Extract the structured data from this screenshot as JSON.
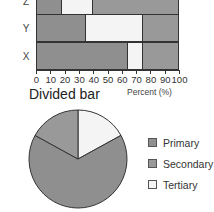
{
  "colors": {
    "primary": "#8f8f8f",
    "secondary": "#999999",
    "tertiary": "#f4f4f4",
    "outline": "#333333"
  },
  "chart_data": [
    {
      "type": "bar",
      "orientation": "horizontal",
      "stacked": true,
      "title": "Divided bar",
      "xlabel": "Percent (%)",
      "ylabel": "",
      "xlim": [
        0,
        100
      ],
      "x_ticks": [
        "0",
        "10",
        "20",
        "30",
        "40",
        "50",
        "60",
        "70",
        "80",
        "90",
        "100"
      ],
      "categories": [
        "Z",
        "Y",
        "X"
      ],
      "series": [
        {
          "name": "Primary",
          "values": [
            18,
            35,
            64
          ]
        },
        {
          "name": "Tertiary",
          "values": [
            22,
            40,
            11
          ]
        },
        {
          "name": "Secondary",
          "values": [
            60,
            25,
            25
          ]
        }
      ],
      "grid": false
    },
    {
      "type": "pie",
      "title": "",
      "labels": [
        "Primary",
        "Secondary",
        "Tertiary"
      ],
      "values": [
        66,
        17,
        17
      ],
      "legend_position": "right"
    }
  ],
  "bar_chart": {
    "title": "Divided bar",
    "xlabel": "Percent (%)",
    "ticks": [
      "0",
      "10",
      "20",
      "30",
      "40",
      "50",
      "60",
      "70",
      "80",
      "90",
      "100"
    ],
    "rows": [
      {
        "label": "Z",
        "segments": [
          {
            "name": "Primary",
            "value": 18
          },
          {
            "name": "Tertiary",
            "value": 22
          },
          {
            "name": "Secondary",
            "value": 60
          }
        ]
      },
      {
        "label": "Y",
        "segments": [
          {
            "name": "Primary",
            "value": 35
          },
          {
            "name": "Tertiary",
            "value": 40
          },
          {
            "name": "Secondary",
            "value": 25
          }
        ]
      },
      {
        "label": "X",
        "segments": [
          {
            "name": "Primary",
            "value": 64
          },
          {
            "name": "Tertiary",
            "value": 11
          },
          {
            "name": "Secondary",
            "value": 25
          }
        ]
      }
    ]
  },
  "legend": {
    "items": [
      {
        "label": "Primary",
        "key": "primary"
      },
      {
        "label": "Secondary",
        "key": "secondary"
      },
      {
        "label": "Tertiary",
        "key": "tertiary"
      }
    ]
  }
}
